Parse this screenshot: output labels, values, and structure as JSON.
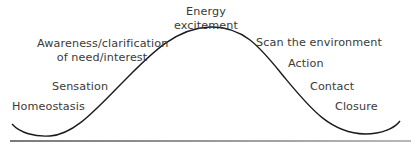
{
  "diagram": {
    "type": "cycle-of-experience-curve",
    "stages": [
      {
        "id": "homeostasis",
        "label": "Homeostasis"
      },
      {
        "id": "sensation",
        "label": "Sensation"
      },
      {
        "id": "awareness",
        "line1": "Awareness/clarification",
        "line2": "of need/interest"
      },
      {
        "id": "energy",
        "line1": "Energy",
        "line2": "excitement"
      },
      {
        "id": "scan",
        "label": "Scan the environment"
      },
      {
        "id": "action",
        "label": "Action"
      },
      {
        "id": "contact",
        "label": "Contact"
      },
      {
        "id": "closure",
        "label": "Closure"
      }
    ],
    "colors": {
      "curve": "#1a1a1a",
      "text": "#3a3a3a",
      "rule": "#8a8a8a"
    }
  }
}
